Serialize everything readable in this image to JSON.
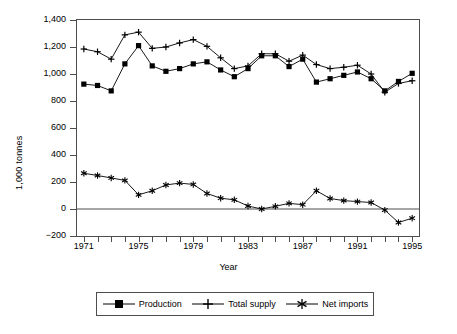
{
  "chart_data": {
    "type": "line",
    "title": "",
    "xlabel": "Year",
    "ylabel": "1,000 tonnes",
    "x": [
      1971,
      1972,
      1973,
      1974,
      1975,
      1976,
      1977,
      1978,
      1979,
      1980,
      1981,
      1982,
      1983,
      1984,
      1985,
      1986,
      1987,
      1988,
      1989,
      1990,
      1991,
      1992,
      1993,
      1994,
      1995
    ],
    "xlim": [
      1970.5,
      1995.5
    ],
    "ylim": [
      -200,
      1400
    ],
    "yticks": [
      -200,
      0,
      200,
      400,
      600,
      800,
      1000,
      1200,
      1400
    ],
    "ytick_labels": [
      "−200",
      "0",
      "200",
      "400",
      "600",
      "800",
      "1,000",
      "1,200",
      "1,400"
    ],
    "xtick_labels": [
      "1971",
      "1975",
      "1979",
      "1983",
      "1987",
      "1991",
      "1995"
    ],
    "xticks_major": [
      1971,
      1975,
      1979,
      1983,
      1987,
      1991,
      1995
    ],
    "grid": false,
    "legend_position": "below",
    "zero_line": 0,
    "series": [
      {
        "name": "Production",
        "marker": "filled-square",
        "color": "#000000",
        "values": [
          925,
          915,
          875,
          1075,
          1210,
          1060,
          1020,
          1040,
          1075,
          1090,
          1030,
          980,
          1040,
          1135,
          1135,
          1055,
          1110,
          940,
          965,
          990,
          1015,
          965,
          875,
          945,
          1005
        ]
      },
      {
        "name": "Total supply",
        "marker": "plus",
        "color": "#000000",
        "values": [
          1185,
          1165,
          1110,
          1290,
          1310,
          1190,
          1200,
          1230,
          1255,
          1205,
          1120,
          1040,
          1060,
          1150,
          1150,
          1095,
          1140,
          1070,
          1040,
          1050,
          1065,
          1000,
          865,
          930,
          950
        ]
      },
      {
        "name": "Net imports",
        "marker": "asterisk",
        "color": "#000000",
        "values": [
          265,
          248,
          230,
          212,
          105,
          135,
          178,
          192,
          182,
          115,
          80,
          68,
          22,
          0,
          20,
          42,
          32,
          135,
          78,
          62,
          55,
          48,
          -8,
          -100,
          -68
        ]
      }
    ]
  },
  "legend": {
    "items": [
      {
        "label": "Production",
        "marker": "filled-square"
      },
      {
        "label": "Total supply",
        "marker": "plus"
      },
      {
        "label": "Net imports",
        "marker": "asterisk"
      }
    ]
  },
  "axes": {
    "y_title": "1,000 tonnes",
    "x_title": "Year"
  }
}
